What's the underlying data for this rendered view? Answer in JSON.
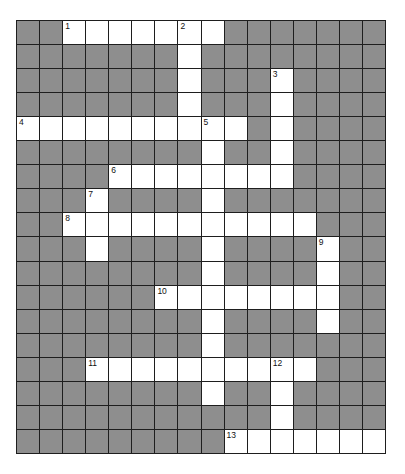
{
  "puzzle": {
    "cols": 16,
    "rows": 18,
    "colors": {
      "block": "#8e8e8e",
      "open": "#ffffff",
      "line": "#1e1e1e"
    },
    "open_rows": [
      "..XXXXXXX.......",
      ".......X........",
      ".......X...X....",
      ".......X...X....",
      "XXXXXXXXXX.X....",
      "........X..X....",
      "....XXXXXXXX....",
      "...X....X.......",
      "..XXXXXXXXXXX...",
      "...X....X....X..",
      "........X....X..",
      "......XXXXXXXX..",
      "........X....X..",
      "........X.......",
      "...XXXXXXXXXX...",
      "........X..X....",
      "...........X....",
      ".........XXXXXXX"
    ],
    "clue_numbers": [
      {
        "n": "1",
        "r": 0,
        "c": 2
      },
      {
        "n": "2",
        "r": 0,
        "c": 7
      },
      {
        "n": "3",
        "r": 2,
        "c": 11
      },
      {
        "n": "4",
        "r": 4,
        "c": 0
      },
      {
        "n": "5",
        "r": 4,
        "c": 8
      },
      {
        "n": "6",
        "r": 6,
        "c": 4
      },
      {
        "n": "7",
        "r": 7,
        "c": 3
      },
      {
        "n": "8",
        "r": 8,
        "c": 2
      },
      {
        "n": "9",
        "r": 9,
        "c": 13
      },
      {
        "n": "10",
        "r": 11,
        "c": 6
      },
      {
        "n": "11",
        "r": 14,
        "c": 3
      },
      {
        "n": "12",
        "r": 14,
        "c": 11
      },
      {
        "n": "13",
        "r": 17,
        "c": 9
      }
    ]
  }
}
